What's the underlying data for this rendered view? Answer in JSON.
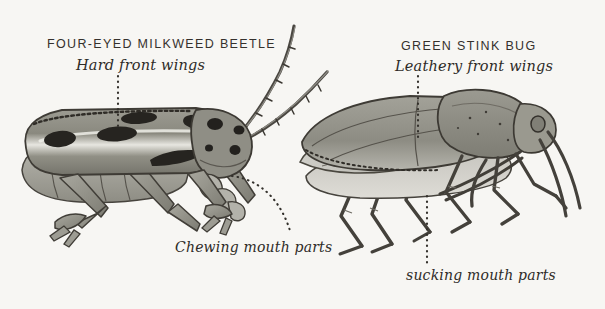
{
  "figure": {
    "background_color": "#f7f6f3",
    "ink_color": "#2e2b27",
    "style": "hand-drawn pen-and-ink entomological illustration, grayscale wash"
  },
  "specimens": [
    {
      "id": "four-eyed-milkweed-beetle",
      "common_name": "FOUR-EYED MILKWEED BEETLE",
      "feature_label": "Hard front wings",
      "mouthpart_label": "Chewing mouth parts",
      "orientation": "left-facing body, head at right",
      "body_color": "#8b8a82",
      "spot_color": "#2b2926",
      "traits": [
        "long segmented antennae",
        "spotted elytra",
        "stout legs",
        "dark eye spots"
      ]
    },
    {
      "id": "green-stink-bug",
      "common_name": "GREEN STINK BUG",
      "feature_label": "Leathery front wings",
      "mouthpart_label": "sucking mouth parts",
      "orientation": "shield-shaped body in profile, head at right",
      "body_color": "#96958c",
      "membrane_color": "#b9b8b0",
      "traits": [
        "shield-shaped pronotum",
        "leathery hemelytra",
        "thin angular legs",
        "beak / rostrum"
      ]
    }
  ],
  "labels": {
    "beetle_title": "FOUR-EYED MILKWEED BEETLE",
    "beetle_sub": "Hard front wings",
    "bug_title": "GREEN STINK BUG",
    "bug_sub": "Leathery front wings",
    "chewing": "Chewing mouth parts",
    "sucking": "sucking mouth parts"
  },
  "leader_lines": [
    {
      "name": "beetle-wing-leader",
      "from": [
        118,
        76
      ],
      "to": [
        118,
        128
      ],
      "style": "dotted-vertical"
    },
    {
      "name": "beetle-mouth-leader",
      "from": [
        232,
        176
      ],
      "to": [
        290,
        234
      ],
      "style": "dotted-curve"
    },
    {
      "name": "bug-wing-leader",
      "from": [
        418,
        76
      ],
      "to": [
        418,
        140
      ],
      "style": "dotted-vertical"
    },
    {
      "name": "bug-mouth-leader",
      "from": [
        427,
        196
      ],
      "to": [
        427,
        262
      ],
      "style": "dotted-vertical"
    }
  ]
}
